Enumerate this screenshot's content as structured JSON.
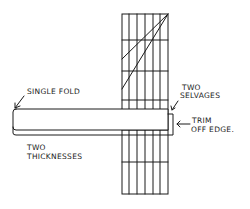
{
  "diagram": {
    "colors": {
      "ink": "#1a1a1a",
      "background": "#ffffff"
    },
    "grid": {
      "x_lines": [
        122,
        129,
        137,
        145,
        153,
        160,
        168
      ],
      "y_lines": [
        14,
        40,
        71,
        100,
        130,
        162,
        194
      ]
    },
    "diagonals": [
      {
        "x1": 168,
        "y1": 14,
        "x2": 122,
        "y2": 59
      },
      {
        "x1": 168,
        "y1": 14,
        "x2": 122,
        "y2": 89
      }
    ],
    "labels": {
      "single_fold": "SINGLE FOLD",
      "two_selvages_line1": "TWO",
      "two_selvages_line2": "SELVAGES",
      "trim_line1": "TRIM",
      "trim_line2": "OFF EDGE.",
      "two_thicknesses_line1": "TWO",
      "two_thicknesses_line2": "THICKNESSES"
    }
  }
}
